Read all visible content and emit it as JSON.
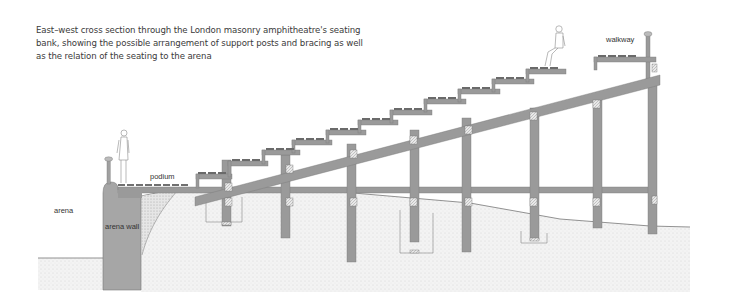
{
  "caption": {
    "lines": [
      "East–west cross section through the London masonry amphitheatre's seating",
      "bank, showing the possible arrangement of support posts and bracing as well",
      "as the relation of the seating to the arena"
    ]
  },
  "diagram": {
    "labels": {
      "arena": "arena",
      "arena_wall": "arena wall",
      "podium": "podium",
      "walkway": "walkway"
    },
    "colors": {
      "timber": "#9a9a9a",
      "timber_dark": "#808080",
      "wall": "#a3a3a3",
      "ground": "#ededed",
      "ground_dots": "#c8c8c8",
      "outline": "#777777"
    },
    "posts_x": [
      230,
      284,
      352,
      412,
      462,
      530,
      592,
      650
    ],
    "seat_rows": 10
  }
}
